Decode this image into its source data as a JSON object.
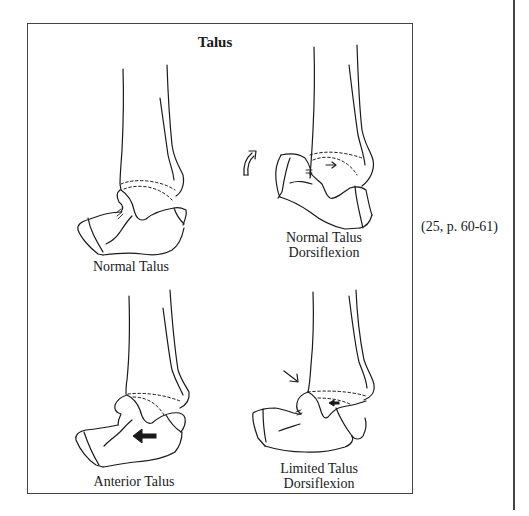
{
  "figure": {
    "title": "Talus",
    "panels": [
      {
        "id": "normal-talus",
        "label_lines": [
          "Normal Talus"
        ]
      },
      {
        "id": "normal-talus-dorsiflexion",
        "label_lines": [
          "Normal Talus",
          "Dorsiflexion"
        ]
      },
      {
        "id": "anterior-talus",
        "label_lines": [
          "Anterior Talus"
        ]
      },
      {
        "id": "limited-talus-dorsiflexion",
        "label_lines": [
          "Limited Talus",
          "Dorsiflexion"
        ]
      }
    ],
    "icons": {
      "curved_arrow": "curved-up-arrow-icon",
      "small_right_arrow": "right-arrow-icon",
      "bold_left_arrow": "left-arrow-icon",
      "diagonal_arrow": "down-right-arrow-icon",
      "small_left_arrow": "left-arrow-icon"
    }
  },
  "citation": "(25, p. 60-61)",
  "colors": {
    "ink": "#1a1a1a",
    "border": "#444444",
    "background": "#ffffff"
  }
}
